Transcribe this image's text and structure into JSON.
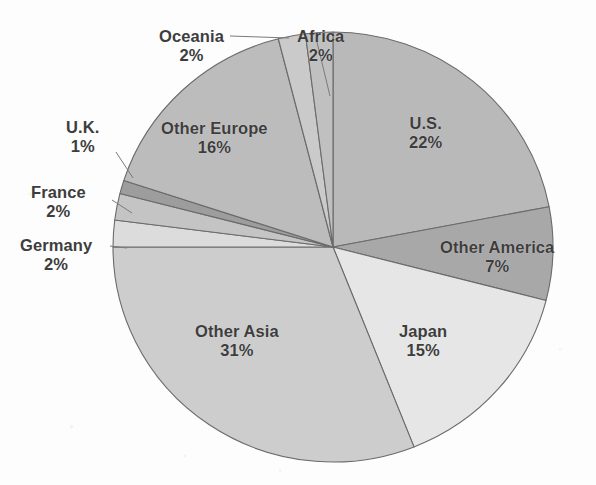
{
  "chart_data": {
    "type": "pie",
    "title": "",
    "subtitle": "",
    "xlabel": "",
    "ylabel": "",
    "legend_position": "none",
    "grid": false,
    "value_suffix": "%",
    "total": 100,
    "start_angle_deg": 0,
    "direction": "clockwise",
    "categories": [
      "U.S.",
      "Other America",
      "Japan",
      "Other Asia",
      "Germany",
      "France",
      "U.K.",
      "Other Europe",
      "Oceania",
      "Africa"
    ],
    "values": [
      22,
      7,
      15,
      31,
      2,
      2,
      1,
      16,
      2,
      2
    ],
    "slices": [
      {
        "label": "U.S.",
        "value": 22,
        "value_text": "22%",
        "color": "#b9b9b9",
        "label_x": 409,
        "label_y": 114,
        "leader": false
      },
      {
        "label": "Other America",
        "value": 7,
        "value_text": "7%",
        "color": "#a8a8a8",
        "label_x": 440,
        "label_y": 238,
        "leader": false
      },
      {
        "label": "Japan",
        "value": 15,
        "value_text": "15%",
        "color": "#e6e6e6",
        "label_x": 399,
        "label_y": 322,
        "leader": false
      },
      {
        "label": "Other Asia",
        "value": 31,
        "value_text": "31%",
        "color": "#cdcdcd",
        "label_x": 195,
        "label_y": 322,
        "leader": false
      },
      {
        "label": "Germany",
        "value": 2,
        "value_text": "2%",
        "color": "#dcdcdc",
        "label_x": 20,
        "label_y": 236,
        "leader": true
      },
      {
        "label": "France",
        "value": 2,
        "value_text": "2%",
        "color": "#c4c4c4",
        "label_x": 31,
        "label_y": 183,
        "leader": true
      },
      {
        "label": "U.K.",
        "value": 1,
        "value_text": "1%",
        "color": "#9d9d9d",
        "label_x": 66,
        "label_y": 118,
        "leader": true
      },
      {
        "label": "Other Europe",
        "value": 16,
        "value_text": "16%",
        "color": "#bcbcbc",
        "label_x": 161,
        "label_y": 119,
        "leader": false
      },
      {
        "label": "Oceania",
        "value": 2,
        "value_text": "2%",
        "color": "#cacaca",
        "label_x": 159,
        "label_y": 27,
        "leader": true
      },
      {
        "label": "Africa",
        "value": 2,
        "value_text": "2%",
        "color": "#c0c0c0",
        "label_x": 297,
        "label_y": 27,
        "leader": true
      }
    ],
    "geometry": {
      "center_x": 333,
      "center_y": 247,
      "radius_x": 220,
      "radius_y": 215,
      "stroke_color": "#6b6b6b",
      "stroke_width": 1.1
    },
    "leaders": [
      {
        "name": "oceania-leader",
        "x1": 230,
        "y1": 36,
        "x2": 289,
        "y2": 38
      },
      {
        "name": "africa-leader",
        "x1": 316,
        "y1": 38,
        "x2": 330,
        "y2": 96
      },
      {
        "name": "uk-leader",
        "x1": 116,
        "y1": 152,
        "x2": 133,
        "y2": 178
      },
      {
        "name": "france-leader",
        "x1": 112,
        "y1": 200,
        "x2": 132,
        "y2": 213
      },
      {
        "name": "germany-leader",
        "x1": 110,
        "y1": 246,
        "x2": 127,
        "y2": 248
      }
    ]
  }
}
